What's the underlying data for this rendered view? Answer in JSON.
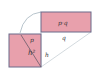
{
  "diagram": {
    "colors": {
      "fill": "#e8a0ac",
      "stroke": "#6a6a8a",
      "guide": "#b8c4cc"
    },
    "square": {
      "label": "h²",
      "side_label": "h",
      "diag_label": "p"
    },
    "rectangle": {
      "label": "p·q",
      "bottom_label": "q"
    }
  }
}
